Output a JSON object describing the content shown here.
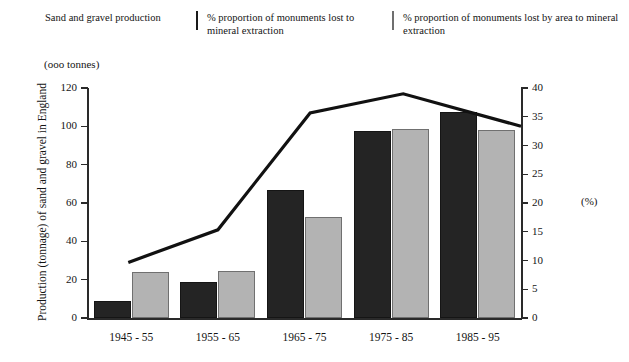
{
  "legend": {
    "items": [
      {
        "key": "line",
        "icon": "line-swatch",
        "label": "Sand and gravel production"
      },
      {
        "key": "dark-bars",
        "icon": "dark-box-swatch",
        "label": "% proportion of monuments lost to mineral extraction"
      },
      {
        "key": "grey-bars",
        "icon": "grey-box-swatch",
        "label": "% proportion of monuments lost by area to mineral extraction"
      }
    ]
  },
  "axes": {
    "left_unit_caption": "(ooo tonnes)",
    "left_title": "Production (tonnage) of sand and gravel in England",
    "right_title": "(%)",
    "left_ticks": [
      "0",
      "20",
      "40",
      "60",
      "80",
      "100",
      "120"
    ],
    "right_ticks": [
      "0",
      "5",
      "10",
      "15",
      "20",
      "25",
      "30",
      "35",
      "40"
    ]
  },
  "colors": {
    "dark_bar": "#242424",
    "grey_bar": "#b3b3b3",
    "grey_bar_border": "#707070",
    "line": "#111111",
    "axis": "#2a2a2a",
    "background": "#ffffff"
  },
  "chart_data": {
    "type": "bar",
    "title": "",
    "categories": [
      "1945 - 55",
      "1955 - 65",
      "1965 - 75",
      "1975 - 85",
      "1985 - 95"
    ],
    "xlabel": "",
    "ylabel": "Production (tonnage) of sand and gravel in England",
    "ylabel_unit": "(ooo tonnes)",
    "ylim": [
      0,
      120
    ],
    "yticks": [
      0,
      20,
      40,
      60,
      80,
      100,
      120
    ],
    "y2label": "(%)",
    "y2lim": [
      0,
      40
    ],
    "y2ticks": [
      0,
      5,
      10,
      15,
      20,
      25,
      30,
      35,
      40
    ],
    "grid": false,
    "legend_position": "top",
    "series": [
      {
        "name": "% proportion of monuments lost to mineral extraction",
        "type": "bar",
        "axis": "right",
        "color": "#242424",
        "values": [
          3.0,
          6.3,
          22.3,
          32.5,
          35.8
        ]
      },
      {
        "name": "% proportion of monuments lost by area to mineral extraction",
        "type": "bar",
        "axis": "right",
        "color": "#b3b3b3",
        "values": [
          8.0,
          8.2,
          17.6,
          32.9,
          32.7
        ]
      },
      {
        "name": "Sand and gravel production",
        "type": "line",
        "axis": "left",
        "color": "#111111",
        "x": [
          "1945 - 55",
          "1950 - 60",
          "1955 - 65",
          "1965 - 75",
          "1970 - 80",
          "1975 - 85",
          "1985 - 95"
        ],
        "values": [
          29,
          46,
          46,
          107,
          117,
          117,
          100
        ],
        "points": [
          {
            "x_frac": 0.093,
            "value": 29
          },
          {
            "x_frac": 0.3,
            "value": 46
          },
          {
            "x_frac": 0.513,
            "value": 107
          },
          {
            "x_frac": 0.728,
            "value": 117
          },
          {
            "x_frac": 1.0,
            "value": 100
          }
        ]
      }
    ]
  }
}
